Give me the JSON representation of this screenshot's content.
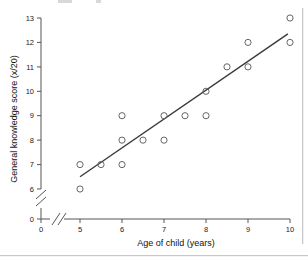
{
  "chart_data": {
    "type": "scatter",
    "title": "",
    "xlabel": "Age of child (years)",
    "ylabel": "General knowledge score (x/20)",
    "xlim": [
      5,
      10
    ],
    "ylim": [
      6,
      13
    ],
    "xticks": [
      "0",
      "5",
      "6",
      "7",
      "8",
      "9",
      "10"
    ],
    "yticks": [
      "0",
      "6",
      "7",
      "8",
      "9",
      "10",
      "11",
      "12",
      "13"
    ],
    "x_axis_break": true,
    "y_axis_break": true,
    "grid": false,
    "legend": null,
    "marker": "open-circle",
    "points": [
      {
        "x": 5,
        "y": 7
      },
      {
        "x": 5,
        "y": 6
      },
      {
        "x": 5.5,
        "y": 7
      },
      {
        "x": 6,
        "y": 9
      },
      {
        "x": 6,
        "y": 8
      },
      {
        "x": 6,
        "y": 7
      },
      {
        "x": 6.5,
        "y": 8
      },
      {
        "x": 7,
        "y": 9
      },
      {
        "x": 7,
        "y": 8
      },
      {
        "x": 7.5,
        "y": 9
      },
      {
        "x": 8,
        "y": 10
      },
      {
        "x": 8,
        "y": 9
      },
      {
        "x": 8.5,
        "y": 11
      },
      {
        "x": 9,
        "y": 12
      },
      {
        "x": 9,
        "y": 11
      },
      {
        "x": 10,
        "y": 13
      },
      {
        "x": 10,
        "y": 12
      }
    ],
    "series": [
      {
        "name": "General knowledge score",
        "x": [
          5,
          5,
          5.5,
          6,
          6,
          6,
          6.5,
          7,
          7,
          7.5,
          8,
          8,
          8.5,
          9,
          9,
          10,
          10
        ],
        "values": [
          7,
          6,
          7,
          9,
          8,
          7,
          8,
          9,
          8,
          9,
          10,
          9,
          11,
          12,
          11,
          13,
          12
        ]
      }
    ],
    "trend_line": {
      "type": "linear-fit",
      "x_start": 5.0,
      "y_start": 6.5,
      "x_end": 9.95,
      "y_end": 12.35
    },
    "colors": {
      "marker_stroke": "#666666",
      "trend_line": "#3a3a3a",
      "axis": "#555555",
      "text": "#111111",
      "background": "#ffffff"
    }
  }
}
